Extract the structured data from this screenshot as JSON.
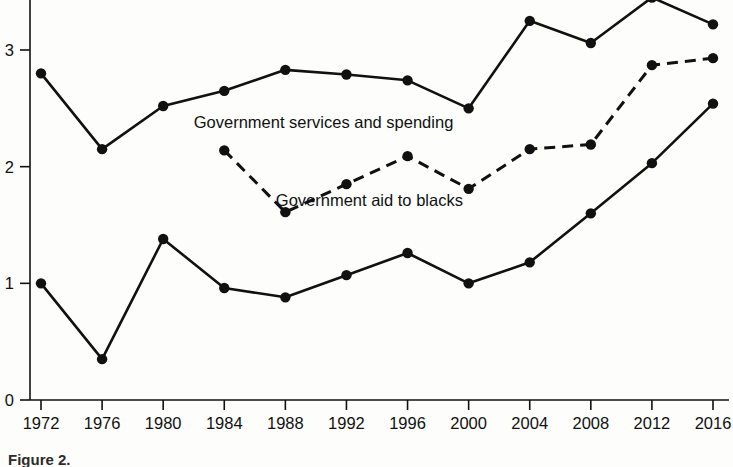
{
  "chart_data": {
    "type": "line",
    "title": "",
    "subtitle": "",
    "xlabel": "",
    "ylabel": "",
    "x": [
      1972,
      1976,
      1980,
      1984,
      1988,
      1992,
      1996,
      2000,
      2004,
      2008,
      2012,
      2016
    ],
    "xtick_labels": [
      "1972",
      "1976",
      "1980",
      "1984",
      "1988",
      "1992",
      "1996",
      "2000",
      "2004",
      "2008",
      "2012",
      "2016"
    ],
    "ytick_labels": [
      "0",
      "1",
      "2",
      "3"
    ],
    "ytick_values": [
      0,
      1,
      2,
      3
    ],
    "xlim": [
      1970,
      2018
    ],
    "ylim": [
      0,
      3.55
    ],
    "grid": false,
    "legend_position": "inline-annotation",
    "series": [
      {
        "name": "Partisan difference (top solid line)",
        "style": "solid",
        "marker": "filled-circle",
        "color": "#111111",
        "x": [
          1972,
          1976,
          1980,
          1984,
          1988,
          1992,
          1996,
          2000,
          2004,
          2008,
          2012,
          2016
        ],
        "values": [
          2.8,
          2.15,
          2.52,
          2.65,
          2.83,
          2.79,
          2.74,
          2.5,
          3.25,
          3.06,
          3.45,
          3.22
        ]
      },
      {
        "name": "Government services and spending",
        "style": "dashed",
        "marker": "filled-circle",
        "color": "#111111",
        "x": [
          1984,
          1988,
          1992,
          1996,
          2000,
          2004,
          2008,
          2012,
          2016
        ],
        "values": [
          2.14,
          1.61,
          1.85,
          2.09,
          1.81,
          2.15,
          2.19,
          2.87,
          2.93
        ]
      },
      {
        "name": "Government aid to blacks",
        "style": "solid",
        "marker": "filled-circle",
        "color": "#111111",
        "x": [
          1972,
          1976,
          1980,
          1984,
          1988,
          1992,
          1996,
          2000,
          2004,
          2008,
          2012,
          2016
        ],
        "values": [
          1.0,
          0.35,
          1.38,
          0.96,
          0.88,
          1.07,
          1.26,
          1.0,
          1.18,
          1.6,
          2.03,
          2.54
        ]
      }
    ],
    "annotations": [
      {
        "text": "Government services and spending",
        "x": 1990.5,
        "y": 2.33
      },
      {
        "text": "Government aid to blacks",
        "x": 1993.5,
        "y": 1.66
      }
    ]
  },
  "caption": {
    "text": "Figure 2."
  }
}
